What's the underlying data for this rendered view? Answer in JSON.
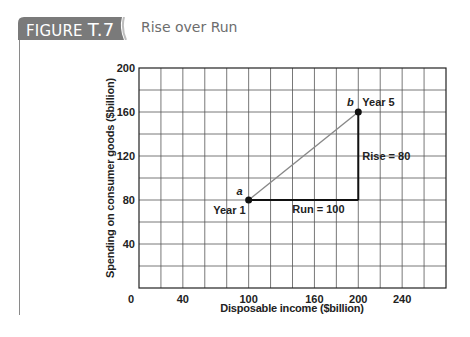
{
  "figure": {
    "label_prefix": "FIGURE ",
    "label_number": "T.7",
    "title": "Rise over Run",
    "tab_color": "#7a7a7a"
  },
  "chart_data": {
    "type": "line",
    "title": "Rise over Run",
    "xlabel": "Disposable income ($billion)",
    "ylabel": "Spending on consumer goods ($billion)",
    "x_tick_labels": [
      {
        "label": "0",
        "grid_col": 0
      },
      {
        "label": "40",
        "grid_col": 2
      },
      {
        "label": "100",
        "grid_col": 5
      },
      {
        "label": "160",
        "grid_col": 8
      },
      {
        "label": "200",
        "grid_col": 10
      },
      {
        "label": "240",
        "grid_col": 12
      }
    ],
    "y_ticks": [
      40,
      80,
      120,
      160,
      200
    ],
    "ylim": [
      0,
      200
    ],
    "grid": {
      "on": true,
      "columns": 14,
      "rows": 10
    },
    "points": [
      {
        "id": "a",
        "label": "Year 1",
        "x": 100,
        "y": 80,
        "grid_col": 5
      },
      {
        "id": "b",
        "label": "Year 5",
        "x": 200,
        "y": 160,
        "grid_col": 10
      }
    ],
    "series": [
      {
        "name": "a to b",
        "x": [
          100,
          200
        ],
        "y": [
          80,
          160
        ]
      }
    ],
    "annotations": [
      {
        "text": "Run = 100",
        "from": [
          100,
          80
        ],
        "to": [
          200,
          80
        ]
      },
      {
        "text": "Rise = 80",
        "from": [
          200,
          80
        ],
        "to": [
          200,
          160
        ]
      }
    ],
    "slope": 0.8
  }
}
